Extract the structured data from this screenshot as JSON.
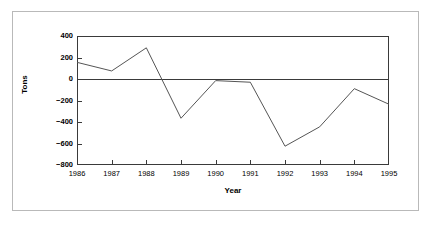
{
  "chart_data": {
    "type": "line",
    "title": "",
    "xlabel": "Year",
    "ylabel": "Tons",
    "categories": [
      "1986",
      "1987",
      "1988",
      "1989",
      "1990",
      "1991",
      "1992",
      "1993",
      "1994",
      "1995"
    ],
    "x": [
      1986,
      1987,
      1988,
      1989,
      1990,
      1991,
      1992,
      1993,
      1994,
      1995
    ],
    "values": [
      155,
      75,
      290,
      -365,
      -15,
      -30,
      -625,
      -445,
      -90,
      -235
    ],
    "series": [
      {
        "name": "Tons",
        "values": [
          155,
          75,
          290,
          -365,
          -15,
          -30,
          -625,
          -445,
          -90,
          -235
        ]
      }
    ],
    "ylim": [
      -800,
      400
    ],
    "yticks": [
      400,
      200,
      0,
      -200,
      -400,
      -600,
      -800
    ],
    "ytick_labels": [
      "400",
      "200",
      "0",
      "−200",
      "−400",
      "−600",
      "−800"
    ],
    "xlim": [
      1986,
      1995
    ],
    "xticks": [
      1986,
      1987,
      1988,
      1989,
      1990,
      1991,
      1992,
      1993,
      1994,
      1995
    ],
    "xtick_labels": [
      "1986",
      "1987",
      "1988",
      "1989",
      "1990",
      "1991",
      "1992",
      "1993",
      "1994",
      "1995"
    ],
    "grid": false,
    "legend": false,
    "zero_line": 0,
    "line_color": "#555555",
    "axis_color": "#3a3a3a",
    "border_color": "#b9b9b9",
    "background_color": "#ffffff"
  }
}
